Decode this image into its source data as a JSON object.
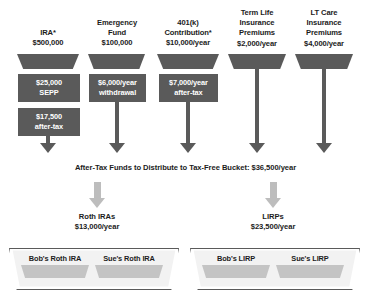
{
  "diagram": {
    "colors": {
      "dark_gray": "#5a5a5a",
      "light_gray": "#bdbdbd",
      "slot_gray": "#c4c4c4",
      "text": "#1c1c1c",
      "background": "#ffffff"
    },
    "sources": [
      {
        "name": "ira",
        "header_lines": [
          "IRA*",
          "$500,000"
        ],
        "boxes": [
          {
            "name": "sepp",
            "lines": [
              "$25,000",
              "SEPP"
            ]
          },
          {
            "name": "after-tax",
            "lines": [
              "$17,500",
              "after-tax"
            ]
          }
        ]
      },
      {
        "name": "emergency-fund",
        "header_lines": [
          "Emergency",
          "Fund",
          "$100,000"
        ],
        "boxes": [
          {
            "name": "withdrawal",
            "lines": [
              "$6,000/year",
              "withdrawal"
            ]
          }
        ]
      },
      {
        "name": "401k-contribution",
        "header_lines": [
          "401(k)",
          "Contribution*",
          "$10,000/year"
        ],
        "boxes": [
          {
            "name": "after-tax",
            "lines": [
              "$7,000/year",
              "after-tax"
            ]
          }
        ]
      },
      {
        "name": "term-life-insurance-premiums",
        "header_lines": [
          "Term Life",
          "Insurance",
          "Premiums",
          "$2,000/year"
        ],
        "boxes": []
      },
      {
        "name": "lt-care-insurance-premiums",
        "header_lines": [
          "LT Care",
          "Insurance",
          "Premiums",
          "$4,000/year"
        ],
        "boxes": []
      }
    ],
    "mid_caption": "After-Tax Funds to Distribute to Tax-Free Bucket: $36,500/year",
    "destinations": [
      {
        "name": "roth-iras",
        "title": "Roth IRAs",
        "amount": "$13,000/year",
        "slots": [
          "Bob's Roth IRA",
          "Sue's Roth IRA"
        ]
      },
      {
        "name": "lirps",
        "title": "LIRPs",
        "amount": "$23,500/year",
        "slots": [
          "Bob's LIRP",
          "Sue's LIRP"
        ]
      }
    ]
  }
}
